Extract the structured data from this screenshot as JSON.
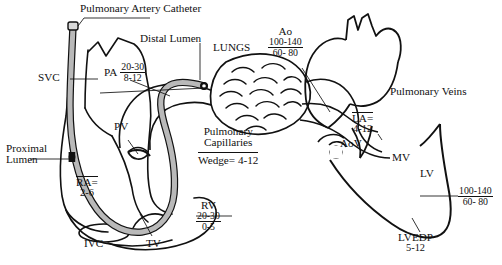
{
  "diagram": {
    "title": "Pulmonary Artery Catheter",
    "domain_label": "cardiac-hemodynamics-diagram"
  },
  "labels": {
    "title": "Pulmonary Artery Catheter",
    "distal_lumen": "Distal Lumen",
    "proximal_lumen_line1": "Proximal",
    "proximal_lumen_line2": "Lumen",
    "svc": "SVC",
    "ivc": "IVC",
    "tv": "TV",
    "pv": "PV",
    "mv": "MV",
    "aov": "AoV",
    "lungs": "LUNGS",
    "pulmonary_veins": "Pulmonary Veins",
    "pulmonary_capillaries_line1": "Pulmonary",
    "pulmonary_capillaries_line2": "Capillaries",
    "wedge_label": "Wedge=",
    "wedge_value": "4-12",
    "pa_label": "PA",
    "ra_label": "RA=",
    "ra_value": "2-6",
    "la_label": "LA=",
    "la_value": "4-12",
    "rv_label": "RV",
    "lv_label": "LV",
    "ao_label": "Ao",
    "lvedp_label": "LVEDP",
    "lvedp_value": "5-12"
  },
  "pressures": {
    "pa": {
      "systolic": "20-30",
      "diastolic": "8-12"
    },
    "rv": {
      "systolic": "20-30",
      "diastolic": "0-5"
    },
    "ao": {
      "systolic": "100-140",
      "diastolic": "60- 80"
    },
    "lv": {
      "systolic": "100-140",
      "diastolic": "60- 80"
    }
  },
  "colors": {
    "ink": "#111111",
    "catheter_fill": "#b9b9b9",
    "background": "#ffffff"
  }
}
